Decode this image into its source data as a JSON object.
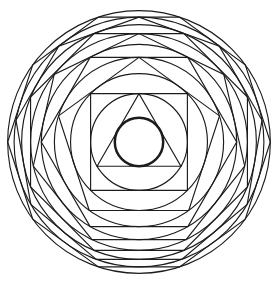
{
  "figure": {
    "width": 279,
    "height": 287,
    "background": "#ffffff",
    "stroke_color": "#1c1c1c",
    "line_width": 1.15,
    "bold_line_width": 2.5,
    "center": {
      "x": 139,
      "y": 142
    },
    "inner_circle_radius": 24.2,
    "orientation": "flat-bottom-tangent",
    "polygons": [
      {
        "sides": 3,
        "name": "triangle"
      },
      {
        "sides": 4,
        "name": "square"
      },
      {
        "sides": 5,
        "name": "pentagon"
      },
      {
        "sides": 6,
        "name": "hexagon"
      },
      {
        "sides": 7,
        "name": "heptagon"
      },
      {
        "sides": 8,
        "name": "octagon"
      },
      {
        "sides": 9,
        "name": "nonagon"
      },
      {
        "sides": 10,
        "name": "decagon"
      }
    ]
  }
}
